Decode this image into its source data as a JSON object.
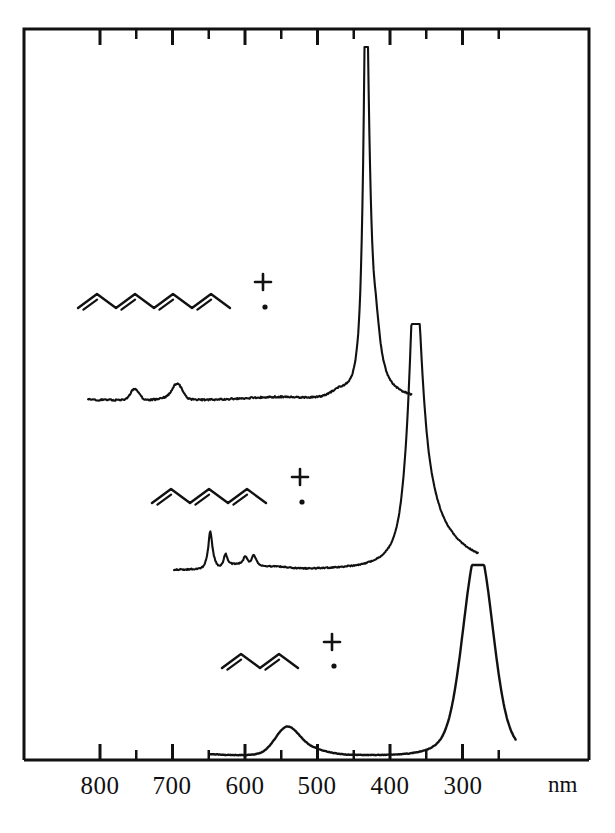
{
  "figure": {
    "frame": {
      "left": 24,
      "right": 589,
      "top": 29,
      "bottom": 760
    },
    "background_color": "#ffffff",
    "line_color": "#111111"
  },
  "axis": {
    "unit": "nm",
    "orientation": "decreasing-left-to-right",
    "major_ticks": [
      800,
      700,
      600,
      500,
      400,
      300
    ],
    "minor_ticks": [
      750,
      650,
      550,
      450,
      350,
      250
    ],
    "tick_labels": [
      "800",
      "700",
      "600",
      "500",
      "400",
      "300"
    ],
    "label_positions_px": [
      100,
      172,
      245,
      317,
      390,
      463
    ],
    "px_per_100nm": 72.5,
    "x_at_800nm_px": 100,
    "range_nm": [
      860,
      230
    ],
    "ticks_inward": true
  },
  "chart_data": {
    "type": "line",
    "xlabel": "nm",
    "ylabel": "",
    "grid": false,
    "legend_position": "inline-structure-labels",
    "xlim": [
      860,
      230
    ],
    "x_axis_inverted": true,
    "series": [
      {
        "name": "octatetraene-radical-cation",
        "label": "octatetraene cation",
        "double_bonds": 4,
        "baseline_y_px": 400,
        "lambda_max_nm": 450,
        "peak_x_px": 366,
        "peak_y_px": 47,
        "secondary_bands_nm": [
          750,
          690
        ],
        "vibronic_shoulders_nm": [
          437,
          425,
          415
        ],
        "trace_start_px": 88,
        "trace_end_px": 412
      },
      {
        "name": "hexatriene-radical-cation",
        "label": "hexatriene cation",
        "double_bonds": 3,
        "baseline_y_px": 570,
        "lambda_max_nm": 393,
        "peak_x_px": 415,
        "peak_y_px": 324,
        "secondary_bands_nm": [
          645,
          620,
          590,
          575
        ],
        "vibronic_shoulders_nm": [
          375
        ],
        "trace_start_px": 174,
        "trace_end_px": 478
      },
      {
        "name": "butadiene-radical-cation",
        "label": "butadiene cation",
        "double_bonds": 2,
        "baseline_y_px": 755,
        "lambda_max_nm": 305,
        "peak_x_px": 478,
        "peak_y_px": 565,
        "secondary_bands_nm": [
          540
        ],
        "vibronic_shoulders_nm": [],
        "trace_start_px": 210,
        "trace_end_px": 516
      }
    ]
  },
  "structures": [
    {
      "name": "octatetraene-structure",
      "formula_label": "octatetraene radical cation",
      "double_bonds": 4,
      "charge_symbol": "+",
      "radical_symbol": "·",
      "origin_px": [
        78,
        308
      ],
      "bond_dx": 19,
      "bond_dy": 14,
      "segments": 8,
      "charge_px": [
        263,
        282
      ],
      "radical_px": [
        265,
        307
      ]
    },
    {
      "name": "hexatriene-structure",
      "formula_label": "hexatriene radical cation",
      "double_bonds": 3,
      "charge_symbol": "+",
      "radical_symbol": "·",
      "origin_px": [
        152,
        503
      ],
      "bond_dx": 19,
      "bond_dy": 14,
      "segments": 6,
      "charge_px": [
        300,
        477
      ],
      "radical_px": [
        302,
        502
      ]
    },
    {
      "name": "butadiene-structure",
      "formula_label": "butadiene radical cation",
      "double_bonds": 2,
      "charge_symbol": "+",
      "radical_symbol": "·",
      "origin_px": [
        222,
        668
      ],
      "bond_dx": 19,
      "bond_dy": 14,
      "segments": 4,
      "charge_px": [
        332,
        642
      ],
      "radical_px": [
        334,
        666
      ]
    }
  ],
  "annotations": {
    "unit_text": "nm",
    "unit_px": [
      548,
      772
    ]
  }
}
